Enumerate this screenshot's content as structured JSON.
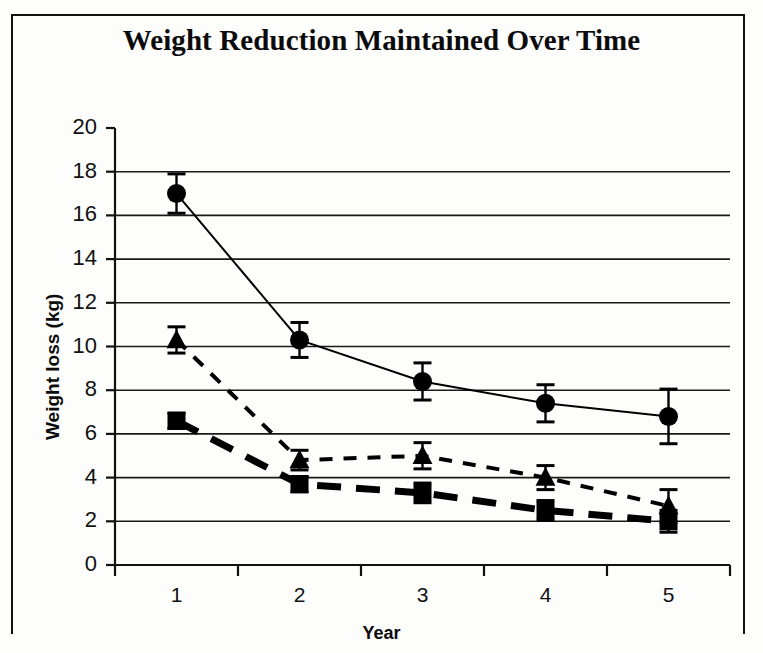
{
  "chart_data": {
    "type": "line",
    "title": "Weight Reduction Maintained Over Time",
    "xlabel": "Year",
    "ylabel": "Weight loss (kg)",
    "categories": [
      "1",
      "2",
      "3",
      "4",
      "5"
    ],
    "x": [
      1,
      2,
      3,
      4,
      5
    ],
    "ylim": [
      0,
      20
    ],
    "ytick_step": 2,
    "yticks": [
      "0",
      "2",
      "4",
      "6",
      "8",
      "10",
      "12",
      "14",
      "16",
      "18",
      "20"
    ],
    "grid": "horizontal",
    "legend": "none",
    "error_bars": "symmetric-capped",
    "series": [
      {
        "name": "circle-series",
        "marker": "circle",
        "line_style": "solid",
        "line_width_px": 2,
        "color": "#000000",
        "values": [
          17.0,
          10.3,
          8.4,
          7.4,
          6.8
        ],
        "errors": [
          0.9,
          0.8,
          0.85,
          0.85,
          1.25
        ]
      },
      {
        "name": "triangle-series",
        "marker": "triangle",
        "line_style": "dashed",
        "line_width_px": 4,
        "color": "#000000",
        "values": [
          10.3,
          4.8,
          5.0,
          4.0,
          2.7
        ],
        "errors": [
          0.6,
          0.45,
          0.6,
          0.55,
          0.75
        ]
      },
      {
        "name": "square-series",
        "marker": "square",
        "line_style": "long-dashed",
        "line_width_px": 7,
        "color": "#000000",
        "values": [
          6.6,
          3.7,
          3.3,
          2.5,
          2.0
        ],
        "errors": [
          0.35,
          0.35,
          0.45,
          0.45,
          0.5
        ]
      }
    ]
  },
  "axis": {
    "y_tick_labels": [
      "20",
      "18",
      "16",
      "14",
      "12",
      "10",
      "8",
      "6",
      "4",
      "2",
      "0"
    ],
    "x_tick_labels": [
      "1",
      "2",
      "3",
      "4",
      "5"
    ]
  }
}
